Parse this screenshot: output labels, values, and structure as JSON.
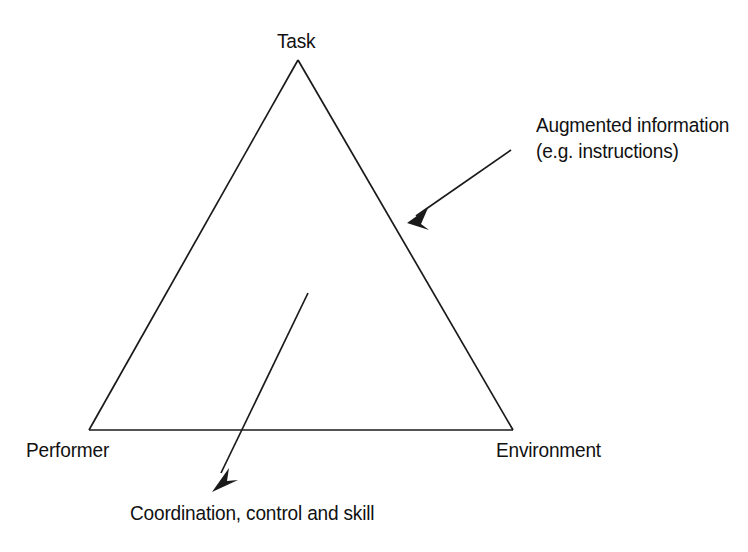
{
  "diagram": {
    "background_color": "#ffffff",
    "stroke_color": "#1a1a1a",
    "text_color": "#111111",
    "vertices": {
      "top": "Task",
      "bottom_left": "Performer",
      "bottom_right": "Environment"
    },
    "annotations": {
      "augmented": {
        "line1": "Augmented information",
        "line2": "(e.g. instructions)"
      },
      "coordination": {
        "line1": "Coordination, control and skill"
      }
    },
    "geometry": {
      "apex_x": 298,
      "apex_y": 60,
      "left_x": 89,
      "left_y": 430,
      "right_x": 513,
      "right_y": 430,
      "augmented_arrow_tail_x": 511,
      "augmented_arrow_tail_y": 150,
      "augmented_arrow_tip_x": 407,
      "augmented_arrow_tip_y": 223,
      "coordination_arrow_tail_x": 308,
      "coordination_arrow_tail_y": 293,
      "coordination_arrow_tip_x": 212,
      "coordination_arrow_tip_y": 492
    }
  }
}
